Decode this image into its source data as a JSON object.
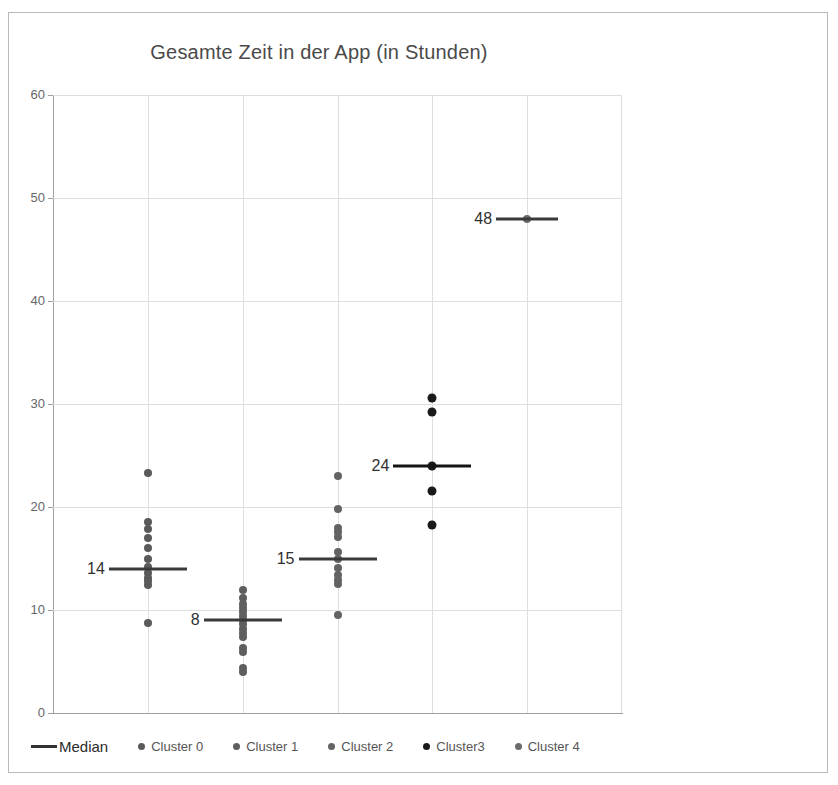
{
  "chart_data": {
    "type": "scatter",
    "title": "Gesamte Zeit in der App (in Stunden)",
    "xlabel": "",
    "ylabel": "",
    "ylim": [
      0,
      60
    ],
    "yticks": [
      0,
      10,
      20,
      30,
      40,
      50,
      60
    ],
    "grid": true,
    "legend_position": "bottom",
    "legend": [
      "Median",
      "Cluster 0",
      "Cluster 1",
      "Cluster 2",
      "Cluster3",
      "Cluster 4"
    ],
    "series": [
      {
        "name": "Cluster 0",
        "category_index": 1,
        "color": "#5a5a5a",
        "median": 14,
        "median_label": "14",
        "values": [
          23.3,
          18.5,
          17.9,
          17.0,
          16.0,
          15.0,
          14.2,
          13.6,
          13.1,
          12.8,
          12.4,
          8.7
        ]
      },
      {
        "name": "Cluster 1",
        "category_index": 2,
        "color": "#5f5f5f",
        "median": 9,
        "median_label": "8",
        "values": [
          11.9,
          11.2,
          10.6,
          10.2,
          9.8,
          9.4,
          9.0,
          8.6,
          8.2,
          7.8,
          7.4,
          6.3,
          5.9,
          4.4,
          4.0
        ]
      },
      {
        "name": "Cluster 2",
        "category_index": 3,
        "color": "#636363",
        "median": 15,
        "median_label": "15",
        "values": [
          23.0,
          19.8,
          18.0,
          17.6,
          17.1,
          15.6,
          15.0,
          14.1,
          13.4,
          12.9,
          12.5,
          9.5
        ]
      },
      {
        "name": "Cluster3",
        "category_index": 4,
        "color": "#1a1a1a",
        "median": 24,
        "median_label": "24",
        "values": [
          30.6,
          29.2,
          24.0,
          21.6,
          18.3
        ]
      },
      {
        "name": "Cluster 4",
        "category_index": 5,
        "color": "#6b6b6b",
        "median": 48,
        "median_label": "48",
        "values": [
          48.0
        ]
      }
    ]
  },
  "legend_items": [
    {
      "label": "Median",
      "marker": "line",
      "color": "#333333"
    },
    {
      "label": "Cluster 0",
      "marker": "dot",
      "color": "#5a5a5a"
    },
    {
      "label": "Cluster 1",
      "marker": "dot",
      "color": "#5f5f5f"
    },
    {
      "label": "Cluster 2",
      "marker": "dot",
      "color": "#636363"
    },
    {
      "label": "Cluster3",
      "marker": "dot",
      "color": "#1a1a1a"
    },
    {
      "label": "Cluster 4",
      "marker": "dot",
      "color": "#6b6b6b"
    }
  ]
}
